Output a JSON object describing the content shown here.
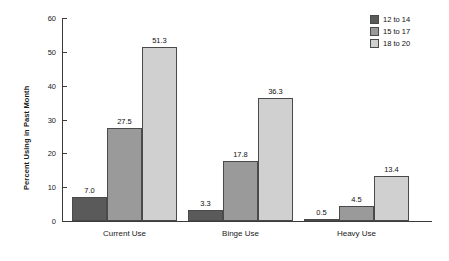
{
  "chart_data": {
    "type": "bar",
    "title": "",
    "subtitle": "",
    "xlabel": "",
    "ylabel": "Percent Using in Past Month",
    "categories": [
      "Current Use",
      "Binge Use",
      "Heavy Use"
    ],
    "series": [
      {
        "name": "12 to 14",
        "color": "#5a5a5a",
        "values": [
          7.0,
          3.3,
          0.5
        ],
        "labels": [
          "7.0",
          "3.3",
          "0.5"
        ]
      },
      {
        "name": "15 to 17",
        "color": "#9a9a9a",
        "values": [
          27.5,
          17.8,
          4.5
        ],
        "labels": [
          "27.5",
          "17.8",
          "4.5"
        ]
      },
      {
        "name": "18 to 20",
        "color": "#d0d0d0",
        "values": [
          51.3,
          36.3,
          13.4
        ],
        "labels": [
          "51.3",
          "36.3",
          "13.4"
        ]
      }
    ],
    "ylim": [
      0,
      60
    ],
    "yticks": [
      0,
      10,
      20,
      30,
      40,
      50,
      60
    ],
    "ytick_labels": [
      "0",
      "10",
      "20",
      "30",
      "40",
      "50",
      "60"
    ],
    "grid": false,
    "legend_position": "top-right",
    "bar_edge_color": "#4a4a4a",
    "axis_color": "#3b3b3b",
    "background": "#ffffff"
  },
  "legend": {
    "items": [
      {
        "label": "12 to 14"
      },
      {
        "label": "15 to 17"
      },
      {
        "label": "18 to 20"
      }
    ]
  },
  "axes": {
    "y_title": "Percent Using in Past Month",
    "y_tick_labels": [
      "60",
      "50",
      "40",
      "30",
      "20",
      "10",
      "0"
    ],
    "x_categories": [
      "Current Use",
      "Binge Use",
      "Heavy Use"
    ]
  }
}
